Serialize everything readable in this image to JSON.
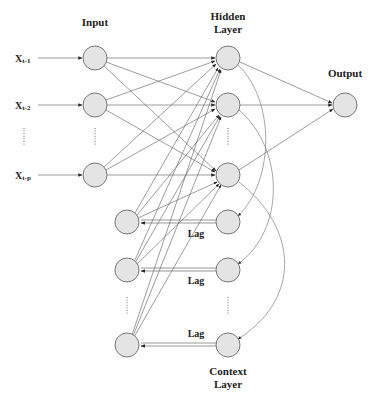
{
  "labels": {
    "input": "Input",
    "hidden_line1": "Hidden",
    "hidden_line2": "Layer",
    "output": "Output",
    "context_line1": "Context",
    "context_line2": "Layer"
  },
  "inputs": [
    {
      "main": "X",
      "sub": "t-1"
    },
    {
      "main": "X",
      "sub": "t-2"
    },
    {
      "main": "X",
      "sub": "t-p"
    }
  ],
  "lag_labels": [
    "Lag",
    "Lag",
    "Lag"
  ],
  "colors": {
    "node_fill": "#e4e4e4",
    "node_stroke": "#6a6a6a",
    "edge": "#5a5a5a"
  },
  "layout": {
    "input_nodes": [
      [
        95,
        58
      ],
      [
        95,
        105
      ],
      [
        95,
        175
      ]
    ],
    "hidden_nodes": [
      [
        228,
        58
      ],
      [
        228,
        105
      ],
      [
        228,
        175
      ]
    ],
    "output_node": [
      345,
      105
    ],
    "context_left": [
      [
        127,
        222
      ],
      [
        127,
        270
      ],
      [
        127,
        345
      ]
    ],
    "context_right": [
      [
        228,
        222
      ],
      [
        228,
        270
      ],
      [
        228,
        345
      ]
    ],
    "radius": 12
  }
}
